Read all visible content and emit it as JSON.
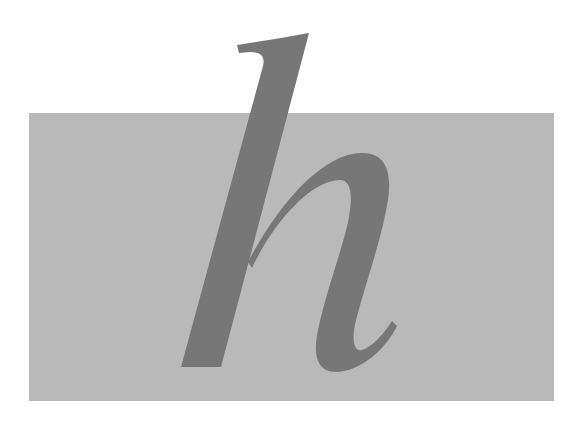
{
  "image": {
    "letter": "h",
    "style": "italic serif lowercase letterform",
    "colors": {
      "background": "#ffffff",
      "panel": "#b9b9b9",
      "letter": "#777777"
    }
  }
}
